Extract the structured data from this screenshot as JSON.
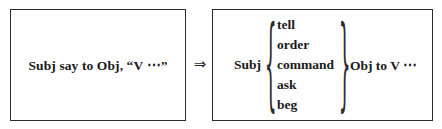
{
  "diagram": {
    "type": "transformation-rule",
    "relation_symbol": "⇒",
    "relation_name": "implies-arrow-icon",
    "colors": {
      "background": "#ffffff",
      "border": "#2b2b2b",
      "text": "#1a1a1a"
    },
    "left_box": {
      "label": "source-pattern",
      "text": "Subj say to Obj, “V ⋯”"
    },
    "right_box": {
      "label": "target-pattern",
      "subject": "Subj",
      "brace_open": "{",
      "brace_close": "}",
      "verbs": [
        "tell",
        "order",
        "command",
        "ask",
        "beg"
      ],
      "tail": "Obj to V ⋯"
    }
  }
}
